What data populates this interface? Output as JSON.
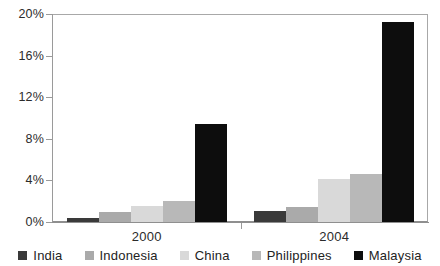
{
  "chart_data": {
    "type": "bar",
    "title": "",
    "xlabel": "",
    "ylabel": "",
    "categories": [
      "2000",
      "2004"
    ],
    "series": [
      {
        "name": "India",
        "color": "#3a3a3a",
        "values": [
          0.4,
          1.1
        ]
      },
      {
        "name": "Indonesia",
        "color": "#aaaaaa",
        "values": [
          1.0,
          1.4
        ]
      },
      {
        "name": "China",
        "color": "#d9d9d9",
        "values": [
          1.5,
          4.1
        ]
      },
      {
        "name": "Philippines",
        "color": "#b8b8b8",
        "values": [
          2.0,
          4.6
        ]
      },
      {
        "name": "Malaysia",
        "color": "#0d0d0d",
        "values": [
          9.4,
          19.2
        ]
      }
    ],
    "ylim": [
      0,
      20
    ],
    "yticks": [
      0,
      4,
      8,
      12,
      16,
      20
    ],
    "ytick_labels": [
      "0%",
      "4%",
      "8%",
      "12%",
      "16%",
      "20%"
    ],
    "grid": false,
    "legend_position": "bottom",
    "value_suffix": "%"
  },
  "legend": {
    "items": [
      {
        "label": "India"
      },
      {
        "label": "Indonesia"
      },
      {
        "label": "China"
      },
      {
        "label": "Philippines"
      },
      {
        "label": "Malaysia"
      }
    ]
  },
  "axis": {
    "x_labels": [
      "2000",
      "2004"
    ],
    "y_labels": [
      "20%",
      "16%",
      "12%",
      "8%",
      "4%",
      "0%"
    ]
  },
  "title_strip": {
    "text": ""
  }
}
